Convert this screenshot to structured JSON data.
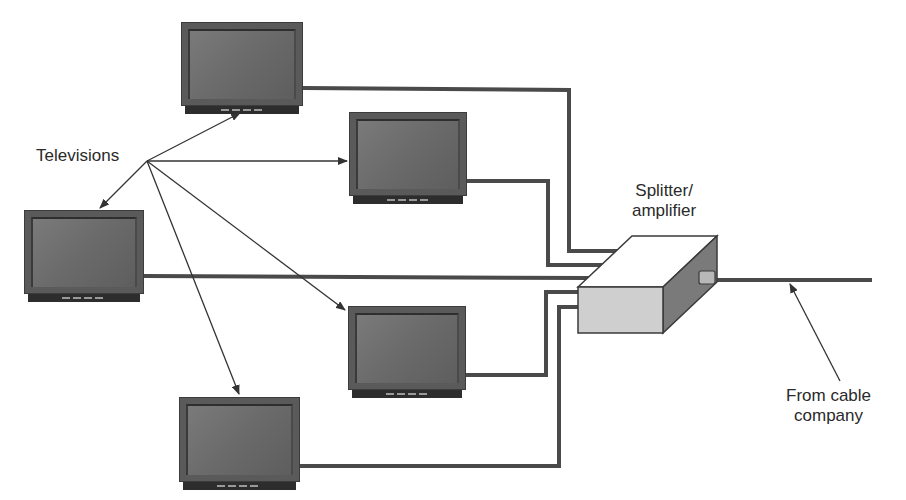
{
  "diagram": {
    "labels": {
      "televisions": "Televisions",
      "splitter_line1": "Splitter/",
      "splitter_line2": "amplifier",
      "cable_line1": "From cable",
      "cable_line2": "company"
    },
    "televisions": [
      {
        "id": "tv-top",
        "x": 181,
        "y": 22,
        "w": 122,
        "h": 86
      },
      {
        "id": "tv-upper-middle",
        "x": 349,
        "y": 112,
        "w": 118,
        "h": 86
      },
      {
        "id": "tv-left",
        "x": 24,
        "y": 210,
        "w": 120,
        "h": 86
      },
      {
        "id": "tv-lower-middle",
        "x": 348,
        "y": 306,
        "w": 118,
        "h": 86
      },
      {
        "id": "tv-bottom",
        "x": 179,
        "y": 397,
        "w": 121,
        "h": 86
      }
    ],
    "splitter": {
      "front_color": "#cfcfcf",
      "top_color": "#ffffff",
      "side_color": "#7a7a7a"
    },
    "colors": {
      "cable": "#4a4a4a",
      "arrow": "#333333",
      "text": "#2a2a2a"
    }
  }
}
